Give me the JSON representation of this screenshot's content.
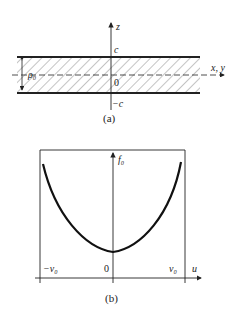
{
  "figure_a": {
    "caption": "(a)",
    "axis_vertical_label": "z",
    "axis_horizontal_label": "x, y",
    "top_label": "c",
    "origin_label": "0",
    "bottom_label": "−c",
    "density_label": "ρ₀"
  },
  "figure_b": {
    "caption": "(b)",
    "axis_vertical_label": "f₀",
    "axis_horizontal_label": "u",
    "left_label": "−v₀",
    "origin_label": "0",
    "right_label": "v₀"
  },
  "colors": {
    "ink": "#222222",
    "background": "#ffffff"
  }
}
